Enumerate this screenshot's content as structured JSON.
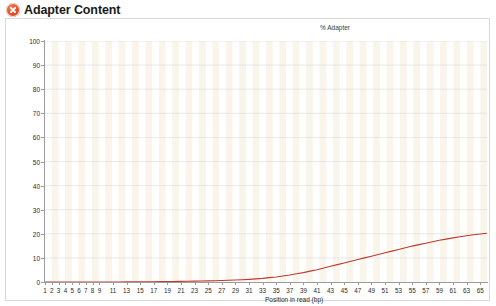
{
  "header": {
    "title": "Adapter Content",
    "status_icon": "fail-cross-icon",
    "status": "fail",
    "status_color": "#e8502a"
  },
  "chart_data": {
    "type": "line",
    "title": "% Adapter",
    "xlabel": "Position in read (bp)",
    "ylabel": "",
    "xlim": [
      1,
      66
    ],
    "ylim": [
      0,
      100
    ],
    "grid": true,
    "legend_position": "none",
    "line_color": "#c0392b",
    "background_stripe_color": "#faf5ea",
    "background_base_color": "#ffffff",
    "ytick_labels": [
      "0",
      "10",
      "20",
      "30",
      "40",
      "50",
      "60",
      "70",
      "80",
      "90",
      "100"
    ],
    "ytick_values": [
      0,
      10,
      20,
      30,
      40,
      50,
      60,
      70,
      80,
      90,
      100
    ],
    "xtick_labels": [
      "1",
      "2",
      "3",
      "4",
      "5",
      "6",
      "7",
      "8",
      "9",
      "11",
      "13",
      "15",
      "17",
      "19",
      "21",
      "23",
      "25",
      "27",
      "29",
      "31",
      "33",
      "35",
      "37",
      "39",
      "41",
      "43",
      "45",
      "47",
      "49",
      "51",
      "53",
      "55",
      "57",
      "59",
      "61",
      "63",
      "65"
    ],
    "xtick_values": [
      1,
      2,
      3,
      4,
      5,
      6,
      7,
      8,
      9,
      11,
      13,
      15,
      17,
      19,
      21,
      23,
      25,
      27,
      29,
      31,
      33,
      35,
      37,
      39,
      41,
      43,
      45,
      47,
      49,
      51,
      53,
      55,
      57,
      59,
      61,
      63,
      65
    ],
    "series": [
      {
        "name": "Illumina Universal Adapter",
        "color": "#c0392b",
        "x": [
          1,
          2,
          3,
          4,
          5,
          6,
          7,
          8,
          9,
          10,
          11,
          12,
          13,
          14,
          15,
          16,
          17,
          18,
          19,
          20,
          21,
          22,
          23,
          24,
          25,
          26,
          27,
          28,
          29,
          30,
          31,
          32,
          33,
          34,
          35,
          36,
          37,
          38,
          39,
          40,
          41,
          42,
          43,
          44,
          45,
          46,
          47,
          48,
          49,
          50,
          51,
          52,
          53,
          54,
          55,
          56,
          57,
          58,
          59,
          60,
          61,
          62,
          63,
          64,
          65,
          66
        ],
        "values": [
          0.0,
          0.0,
          0.0,
          0.0,
          0.0,
          0.0,
          0.0,
          0.0,
          0.0,
          0.0,
          0.0,
          0.02,
          0.04,
          0.06,
          0.08,
          0.1,
          0.12,
          0.15,
          0.18,
          0.22,
          0.26,
          0.3,
          0.35,
          0.4,
          0.46,
          0.53,
          0.6,
          0.7,
          0.8,
          0.95,
          1.1,
          1.3,
          1.5,
          1.8,
          2.1,
          2.5,
          2.9,
          3.4,
          3.9,
          4.5,
          5.1,
          5.8,
          6.5,
          7.2,
          7.9,
          8.6,
          9.3,
          10.0,
          10.7,
          11.4,
          12.1,
          12.8,
          13.5,
          14.2,
          14.9,
          15.5,
          16.1,
          16.7,
          17.3,
          17.8,
          18.3,
          18.8,
          19.2,
          19.6,
          19.9,
          20.2
        ]
      }
    ]
  }
}
